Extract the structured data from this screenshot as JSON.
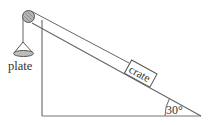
{
  "diagram": {
    "type": "inclined-plane-pulley",
    "labels": {
      "plate": "plate",
      "crate": "crate",
      "angle": "30°"
    },
    "angle_degrees": 30,
    "colors": {
      "line": "#555555",
      "text": "#333333",
      "pulley_fill": "#aaaaaa",
      "plate_fill": "#bbbbbb"
    }
  }
}
